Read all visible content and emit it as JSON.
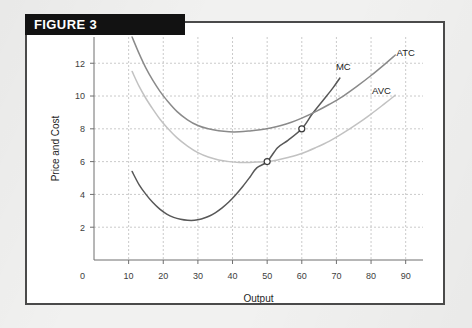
{
  "figure": {
    "header_label": "FIGURE 3",
    "header_bg": "#121212",
    "header_text_color": "#ffffff",
    "border_color": "#4a4a4a",
    "page_bg": "#f1f1f0",
    "card_bg": "#ffffff"
  },
  "chart_data": {
    "type": "line",
    "title": "FIGURE 3",
    "xlabel": "Output",
    "ylabel": "Price and Cost",
    "xlim": [
      0,
      95
    ],
    "ylim": [
      0,
      13.6
    ],
    "xticks": [
      0,
      10,
      20,
      30,
      40,
      50,
      60,
      70,
      80,
      90
    ],
    "yticks": [
      0,
      2,
      4,
      6,
      8,
      10,
      12
    ],
    "grid": true,
    "legend_position": "inline-end-of-curve",
    "series": [
      {
        "name": "MC",
        "label": "MC",
        "color": "#585858",
        "label_x": 72,
        "label_y": 11.6,
        "points": [
          [
            11,
            5.4
          ],
          [
            13,
            4.6
          ],
          [
            15,
            4.0
          ],
          [
            17,
            3.5
          ],
          [
            19,
            3.1
          ],
          [
            21,
            2.8
          ],
          [
            23,
            2.6
          ],
          [
            25,
            2.48
          ],
          [
            27,
            2.42
          ],
          [
            29,
            2.42
          ],
          [
            31,
            2.5
          ],
          [
            33,
            2.65
          ],
          [
            35,
            2.88
          ],
          [
            37,
            3.18
          ],
          [
            39,
            3.55
          ],
          [
            41,
            4.0
          ],
          [
            43,
            4.5
          ],
          [
            45,
            5.05
          ],
          [
            47,
            5.62
          ],
          [
            50,
            6.0
          ],
          [
            53,
            6.85
          ],
          [
            56,
            7.3
          ],
          [
            60,
            8.0
          ],
          [
            63,
            8.9
          ],
          [
            66,
            9.7
          ],
          [
            69,
            10.5
          ],
          [
            71,
            11.1
          ]
        ]
      },
      {
        "name": "ATC",
        "label": "ATC",
        "color": "#8a8a8a",
        "label_x": 90,
        "label_y": 12.45,
        "points": [
          [
            11,
            13.6
          ],
          [
            13,
            12.6
          ],
          [
            15,
            11.7
          ],
          [
            17,
            10.95
          ],
          [
            19,
            10.3
          ],
          [
            21,
            9.75
          ],
          [
            24,
            9.05
          ],
          [
            27,
            8.55
          ],
          [
            30,
            8.2
          ],
          [
            33,
            8.0
          ],
          [
            36,
            7.88
          ],
          [
            39,
            7.82
          ],
          [
            42,
            7.82
          ],
          [
            45,
            7.87
          ],
          [
            48,
            7.94
          ],
          [
            51,
            8.05
          ],
          [
            54,
            8.2
          ],
          [
            57,
            8.4
          ],
          [
            60,
            8.65
          ],
          [
            64,
            9.05
          ],
          [
            68,
            9.5
          ],
          [
            72,
            10.0
          ],
          [
            76,
            10.6
          ],
          [
            80,
            11.25
          ],
          [
            84,
            11.95
          ],
          [
            87,
            12.5
          ]
        ]
      },
      {
        "name": "AVC",
        "label": "AVC",
        "color": "#c2c2c2",
        "label_x": 83,
        "label_y": 10.1,
        "points": [
          [
            11,
            11.5
          ],
          [
            13,
            10.6
          ],
          [
            15,
            9.85
          ],
          [
            17,
            9.2
          ],
          [
            19,
            8.6
          ],
          [
            21,
            8.1
          ],
          [
            24,
            7.45
          ],
          [
            27,
            6.95
          ],
          [
            30,
            6.55
          ],
          [
            33,
            6.28
          ],
          [
            36,
            6.1
          ],
          [
            39,
            6.0
          ],
          [
            42,
            5.95
          ],
          [
            45,
            5.95
          ],
          [
            48,
            5.98
          ],
          [
            50,
            6.0
          ],
          [
            53,
            6.1
          ],
          [
            56,
            6.25
          ],
          [
            60,
            6.5
          ],
          [
            64,
            6.85
          ],
          [
            68,
            7.25
          ],
          [
            72,
            7.75
          ],
          [
            76,
            8.3
          ],
          [
            80,
            8.9
          ],
          [
            84,
            9.55
          ],
          [
            87,
            10.05
          ]
        ]
      }
    ],
    "markers": [
      {
        "name": "mc-avc-intersection",
        "x": 50,
        "y": 6
      },
      {
        "name": "mc-atc-intersection",
        "x": 60,
        "y": 8
      }
    ]
  }
}
